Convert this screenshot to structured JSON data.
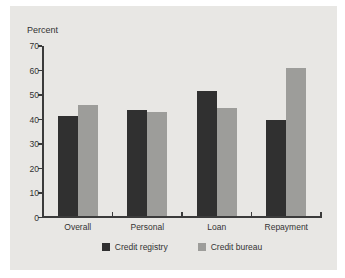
{
  "chart_data": {
    "type": "bar",
    "title": "",
    "ylabel": "Percent",
    "categories": [
      "Overall",
      "Personal",
      "Loan",
      "Repayment"
    ],
    "series": [
      {
        "name": "Credit registry",
        "color": "#303030",
        "values": [
          41.5,
          44,
          51.5,
          40
        ]
      },
      {
        "name": "Credit bureau",
        "color": "#9d9d9a",
        "values": [
          46,
          43,
          44.5,
          61
        ]
      }
    ],
    "ylim": [
      0,
      70
    ],
    "yticks": [
      0,
      10,
      20,
      30,
      40,
      50,
      60,
      70
    ],
    "grid": false,
    "legend_position": "bottom"
  },
  "colors": {
    "page_bg": "#ffffff",
    "panel_bg": "#e8e7e4",
    "axis": "#3b3b3b",
    "text": "#333333"
  }
}
